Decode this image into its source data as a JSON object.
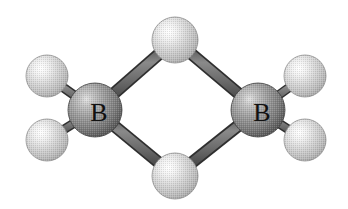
{
  "figure": {
    "kind": "ball-and-stick-molecular-model",
    "molecule_name": "diborane",
    "molecular_formula": "B2H6",
    "background_color": "#ffffff",
    "width": 348,
    "height": 209
  },
  "palette": {
    "boron_sphere_highlight": "#d9d9d9",
    "boron_sphere_mid": "#9a9a9a",
    "boron_sphere_edge": "#4a4a4a",
    "hydrogen_sphere_highlight": "#ffffff",
    "hydrogen_sphere_mid": "#d0d0d0",
    "hydrogen_sphere_edge": "#808080",
    "bond_fill": "#6e6e6e",
    "bond_outline": "#3a3a3a",
    "label_color": "#111111"
  },
  "atoms": [
    {
      "id": "boron-left",
      "element": "B",
      "label": "B",
      "role": "boron-center",
      "cx": 95,
      "cy": 110,
      "r": 27,
      "label_x": 99,
      "label_y": 112
    },
    {
      "id": "boron-right",
      "element": "B",
      "label": "B",
      "role": "boron-center",
      "cx": 258,
      "cy": 110,
      "r": 27,
      "label_x": 262,
      "label_y": 112
    },
    {
      "id": "hydrogen-bridge-top",
      "element": "H",
      "label": "",
      "role": "bridging-hydrogen",
      "cx": 175,
      "cy": 40,
      "r": 23,
      "label_x": 175,
      "label_y": 40
    },
    {
      "id": "hydrogen-bridge-bottom",
      "element": "H",
      "label": "",
      "role": "bridging-hydrogen",
      "cx": 175,
      "cy": 176,
      "r": 23,
      "label_x": 175,
      "label_y": 176
    },
    {
      "id": "hydrogen-terminal-upper-left",
      "element": "H",
      "label": "",
      "role": "terminal-hydrogen",
      "cx": 47,
      "cy": 76,
      "r": 21,
      "label_x": 47,
      "label_y": 76
    },
    {
      "id": "hydrogen-terminal-lower-left",
      "element": "H",
      "label": "",
      "role": "terminal-hydrogen",
      "cx": 47,
      "cy": 140,
      "r": 21,
      "label_x": 47,
      "label_y": 140
    },
    {
      "id": "hydrogen-terminal-upper-right",
      "element": "H",
      "label": "",
      "role": "terminal-hydrogen",
      "cx": 305,
      "cy": 76,
      "r": 21,
      "label_x": 305,
      "label_y": 76
    },
    {
      "id": "hydrogen-terminal-lower-right",
      "element": "H",
      "label": "",
      "role": "terminal-hydrogen",
      "cx": 305,
      "cy": 140,
      "r": 21,
      "label_x": 305,
      "label_y": 140
    }
  ],
  "bonds": [
    {
      "id": "bond-boron-left-bridge-top",
      "type": "bridge",
      "from": "boron-left",
      "to": "hydrogen-bridge-top",
      "x1": 95,
      "y1": 110,
      "x2": 175,
      "y2": 40,
      "width": 11
    },
    {
      "id": "bond-boron-right-bridge-top",
      "type": "bridge",
      "from": "boron-right",
      "to": "hydrogen-bridge-top",
      "x1": 258,
      "y1": 110,
      "x2": 175,
      "y2": 40,
      "width": 11
    },
    {
      "id": "bond-boron-left-bridge-bottom",
      "type": "bridge",
      "from": "boron-left",
      "to": "hydrogen-bridge-bottom",
      "x1": 95,
      "y1": 110,
      "x2": 175,
      "y2": 176,
      "width": 11
    },
    {
      "id": "bond-boron-right-bridge-bottom",
      "type": "bridge",
      "from": "boron-right",
      "to": "hydrogen-bridge-bottom",
      "x1": 258,
      "y1": 110,
      "x2": 175,
      "y2": 176,
      "width": 11
    },
    {
      "id": "bond-boron-left-terminal-upper",
      "type": "terminal",
      "from": "boron-left",
      "to": "hydrogen-terminal-upper-left",
      "x1": 95,
      "y1": 110,
      "x2": 47,
      "y2": 76,
      "width": 8
    },
    {
      "id": "bond-boron-left-terminal-lower",
      "type": "terminal",
      "from": "boron-left",
      "to": "hydrogen-terminal-lower-left",
      "x1": 95,
      "y1": 110,
      "x2": 47,
      "y2": 140,
      "width": 8
    },
    {
      "id": "bond-boron-right-terminal-upper",
      "type": "terminal",
      "from": "boron-right",
      "to": "hydrogen-terminal-upper-right",
      "x1": 258,
      "y1": 110,
      "x2": 305,
      "y2": 76,
      "width": 8
    },
    {
      "id": "bond-boron-right-terminal-lower",
      "type": "terminal",
      "from": "boron-right",
      "to": "hydrogen-terminal-lower-right",
      "x1": 258,
      "y1": 110,
      "x2": 305,
      "y2": 140,
      "width": 8
    }
  ]
}
